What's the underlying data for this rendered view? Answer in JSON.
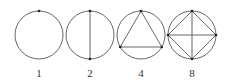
{
  "diagram": {
    "type": "circle-chord-regions",
    "stroke_color": "#555555",
    "figures": [
      {
        "label": "1",
        "points": 1,
        "cx": 39,
        "cy": 35,
        "r": 24
      },
      {
        "label": "2",
        "points": 2,
        "cx": 90,
        "cy": 35,
        "r": 24
      },
      {
        "label": "4",
        "points": 3,
        "cx": 141,
        "cy": 35,
        "r": 24
      },
      {
        "label": "8",
        "points": 4,
        "cx": 192,
        "cy": 35,
        "r": 24
      }
    ]
  }
}
